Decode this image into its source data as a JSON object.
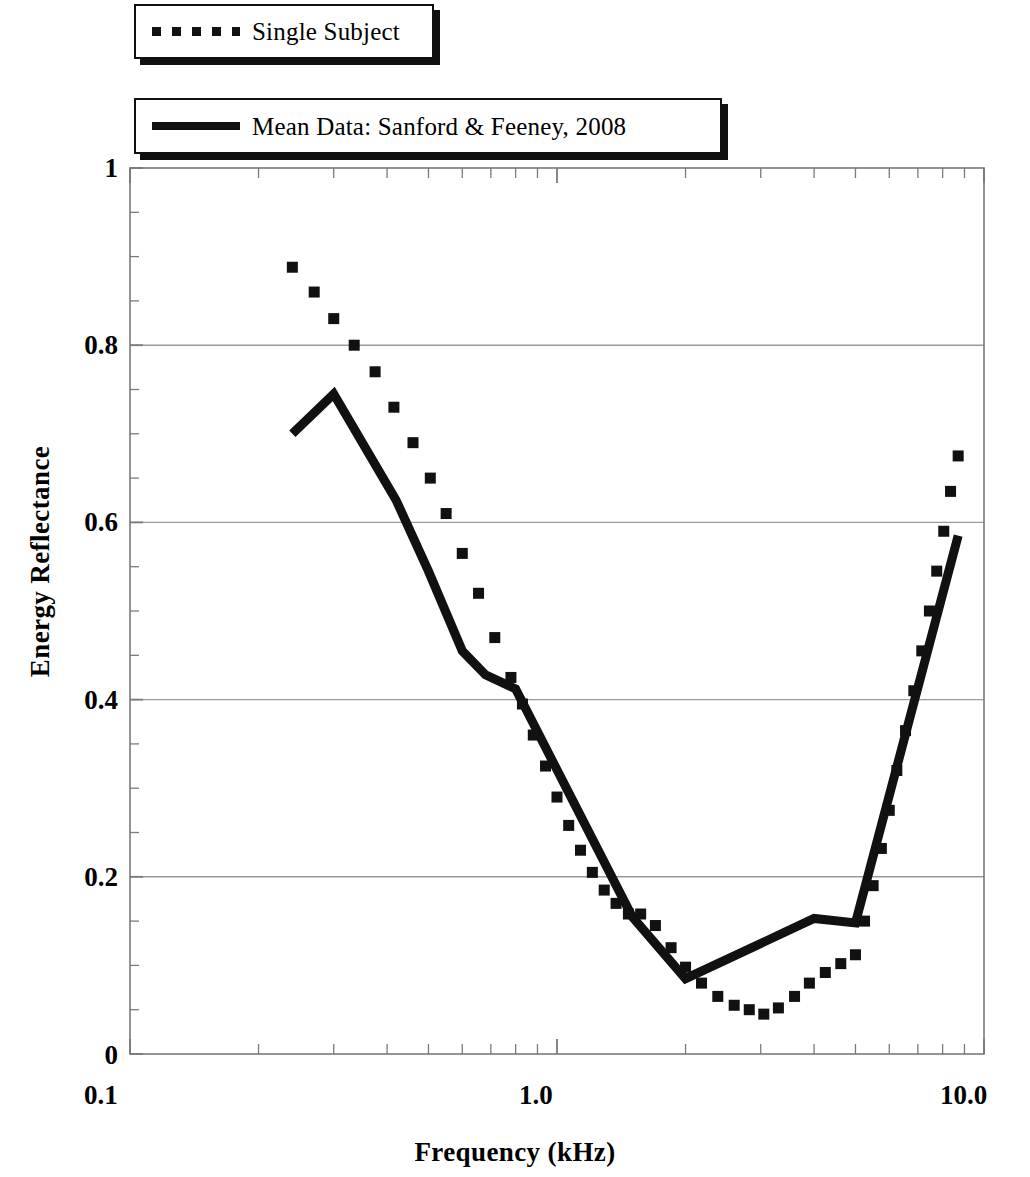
{
  "legend": {
    "position": "top-left",
    "entries": [
      {
        "label": "Single Subject",
        "style": "dotted",
        "marker": "dotted-line-swatch"
      },
      {
        "label": "Mean Data: Sanford & Feeney, 2008",
        "style": "solid",
        "marker": "solid-line-swatch"
      }
    ]
  },
  "axes": {
    "x_label": "Frequency (kHz)",
    "y_label": "Energy Reflectance",
    "x_tick_labels": [
      "0.1",
      "1.0",
      "10.0"
    ],
    "y_tick_labels": [
      "0",
      "0.2",
      "0.4",
      "0.6",
      "0.8",
      "1"
    ]
  },
  "colors": {
    "line": "#111111",
    "grid": "#9a9a9a",
    "axis": "#7a7a7a",
    "background": "#ffffff"
  },
  "chart_data": {
    "type": "line",
    "title": "",
    "subtitle": "",
    "xlabel": "Frequency (kHz)",
    "ylabel": "Energy Reflectance",
    "xscale": "log",
    "yscale": "linear",
    "xlim": [
      0.1,
      10.0
    ],
    "ylim": [
      0,
      1
    ],
    "x_ticks_major": [
      0.1,
      1.0,
      10.0
    ],
    "x_tick_labels": [
      "0.1",
      "1.0",
      "10.0"
    ],
    "x_ticks_minor": [
      0.2,
      0.3,
      0.4,
      0.5,
      0.6,
      0.7,
      0.8,
      0.9,
      2,
      3,
      4,
      5,
      6,
      7,
      8,
      9
    ],
    "y_ticks_major": [
      0,
      0.2,
      0.4,
      0.6,
      0.8,
      1
    ],
    "y_ticks_minor": [
      0.05,
      0.1,
      0.15,
      0.25,
      0.3,
      0.35,
      0.45,
      0.5,
      0.55,
      0.65,
      0.7,
      0.75,
      0.85,
      0.9,
      0.95
    ],
    "grid": {
      "horizontal": [
        0.2,
        0.4,
        0.6,
        0.8
      ],
      "vertical": []
    },
    "legend_position": "top-left",
    "annotations": [],
    "series": [
      {
        "name": "Single Subject",
        "style": "dotted",
        "color": "#111111",
        "points": [
          [
            0.24,
            0.888
          ],
          [
            0.27,
            0.86
          ],
          [
            0.3,
            0.83
          ],
          [
            0.335,
            0.8
          ],
          [
            0.375,
            0.77
          ],
          [
            0.415,
            0.73
          ],
          [
            0.46,
            0.69
          ],
          [
            0.505,
            0.65
          ],
          [
            0.55,
            0.61
          ],
          [
            0.6,
            0.565
          ],
          [
            0.655,
            0.52
          ],
          [
            0.715,
            0.47
          ],
          [
            0.78,
            0.425
          ],
          [
            0.83,
            0.395
          ],
          [
            0.88,
            0.36
          ],
          [
            0.94,
            0.325
          ],
          [
            1.0,
            0.29
          ],
          [
            1.065,
            0.258
          ],
          [
            1.135,
            0.23
          ],
          [
            1.21,
            0.205
          ],
          [
            1.29,
            0.185
          ],
          [
            1.375,
            0.17
          ],
          [
            1.47,
            0.158
          ],
          [
            1.57,
            0.158
          ],
          [
            1.7,
            0.145
          ],
          [
            1.85,
            0.12
          ],
          [
            2.0,
            0.098
          ],
          [
            2.18,
            0.08
          ],
          [
            2.38,
            0.065
          ],
          [
            2.6,
            0.055
          ],
          [
            2.82,
            0.05
          ],
          [
            3.05,
            0.045
          ],
          [
            3.3,
            0.052
          ],
          [
            3.6,
            0.065
          ],
          [
            3.9,
            0.08
          ],
          [
            4.25,
            0.092
          ],
          [
            4.62,
            0.102
          ],
          [
            5.0,
            0.112
          ],
          [
            5.25,
            0.15
          ],
          [
            5.5,
            0.19
          ],
          [
            5.75,
            0.232
          ],
          [
            6.0,
            0.275
          ],
          [
            6.25,
            0.32
          ],
          [
            6.55,
            0.365
          ],
          [
            6.85,
            0.41
          ],
          [
            7.15,
            0.455
          ],
          [
            7.45,
            0.5
          ],
          [
            7.75,
            0.545
          ],
          [
            8.05,
            0.59
          ],
          [
            8.35,
            0.635
          ],
          [
            8.7,
            0.675
          ]
        ]
      },
      {
        "name": "Mean Data: Sanford & Feeney, 2008",
        "style": "solid",
        "color": "#111111",
        "points": [
          [
            0.24,
            0.7
          ],
          [
            0.3,
            0.745
          ],
          [
            0.42,
            0.625
          ],
          [
            0.5,
            0.545
          ],
          [
            0.6,
            0.455
          ],
          [
            0.68,
            0.428
          ],
          [
            0.8,
            0.412
          ],
          [
            1.5,
            0.155
          ],
          [
            2.0,
            0.085
          ],
          [
            4.0,
            0.153
          ],
          [
            5.0,
            0.148
          ],
          [
            8.7,
            0.585
          ]
        ]
      }
    ]
  }
}
